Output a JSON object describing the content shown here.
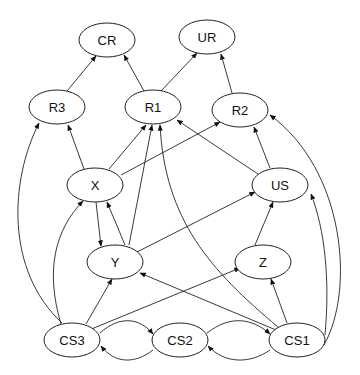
{
  "diagram": {
    "type": "directed-graph",
    "nodes": [
      {
        "id": "CR",
        "label": "CR",
        "x": 107,
        "y": 40
      },
      {
        "id": "UR",
        "label": "UR",
        "x": 207,
        "y": 37
      },
      {
        "id": "R3",
        "label": "R3",
        "x": 57,
        "y": 107
      },
      {
        "id": "R1",
        "label": "R1",
        "x": 153,
        "y": 107
      },
      {
        "id": "R2",
        "label": "R2",
        "x": 240,
        "y": 110
      },
      {
        "id": "X",
        "label": "X",
        "x": 95,
        "y": 185
      },
      {
        "id": "US",
        "label": "US",
        "x": 280,
        "y": 185
      },
      {
        "id": "Y",
        "label": "Y",
        "x": 115,
        "y": 262
      },
      {
        "id": "Z",
        "label": "Z",
        "x": 263,
        "y": 262
      },
      {
        "id": "CS3",
        "label": "CS3",
        "x": 72,
        "y": 340
      },
      {
        "id": "CS2",
        "label": "CS2",
        "x": 180,
        "y": 340
      },
      {
        "id": "CS1",
        "label": "CS1",
        "x": 297,
        "y": 340
      }
    ],
    "edges": [
      {
        "from": "R3",
        "to": "CR"
      },
      {
        "from": "R1",
        "to": "CR"
      },
      {
        "from": "R1",
        "to": "UR"
      },
      {
        "from": "R2",
        "to": "UR"
      },
      {
        "from": "X",
        "to": "R3"
      },
      {
        "from": "X",
        "to": "R1"
      },
      {
        "from": "X",
        "to": "R2"
      },
      {
        "from": "US",
        "to": "R1"
      },
      {
        "from": "US",
        "to": "R2"
      },
      {
        "from": "X",
        "to": "Y"
      },
      {
        "from": "Y",
        "to": "X"
      },
      {
        "from": "Y",
        "to": "R1"
      },
      {
        "from": "Y",
        "to": "US"
      },
      {
        "from": "Z",
        "to": "US"
      },
      {
        "from": "CS1",
        "to": "Z"
      },
      {
        "from": "CS1",
        "to": "Y"
      },
      {
        "from": "CS1",
        "to": "R1"
      },
      {
        "from": "CS1",
        "to": "US"
      },
      {
        "from": "CS1",
        "to": "R2"
      },
      {
        "from": "CS3",
        "to": "R3"
      },
      {
        "from": "CS3",
        "to": "X"
      },
      {
        "from": "CS3",
        "to": "Y"
      },
      {
        "from": "CS3",
        "to": "Z"
      },
      {
        "from": "CS3",
        "to": "CS2"
      },
      {
        "from": "CS2",
        "to": "CS3"
      },
      {
        "from": "CS2",
        "to": "CS1"
      },
      {
        "from": "CS1",
        "to": "CS2"
      }
    ]
  }
}
